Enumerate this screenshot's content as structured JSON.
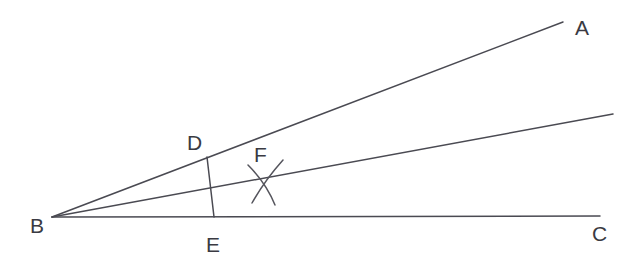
{
  "figure": {
    "kind": "geometry-diagram",
    "background_color": "#ffffff",
    "line_color": "#4a4a52",
    "arc_color": "#55555d",
    "label_color": "#3a3a42",
    "width": 630,
    "height": 277
  },
  "points": {
    "A": {
      "label": "A",
      "x": 575,
      "y": 35
    },
    "B": {
      "label": "B",
      "x": 30,
      "y": 233
    },
    "C": {
      "label": "C",
      "x": 592,
      "y": 241
    },
    "D": {
      "label": "D",
      "x": 187,
      "y": 150
    },
    "E": {
      "label": "E",
      "x": 206,
      "y": 252
    },
    "F": {
      "label": "F",
      "x": 254,
      "y": 162
    }
  },
  "vertices": {
    "B": {
      "x": 52,
      "y": 217
    },
    "A_end": {
      "x": 563,
      "y": 22
    },
    "C_end": {
      "x": 600,
      "y": 216
    },
    "bisector_end": {
      "x": 613,
      "y": 114
    },
    "D": {
      "x": 207,
      "y": 157
    },
    "E": {
      "x": 214,
      "y": 217
    },
    "F": {
      "x": 264,
      "y": 180
    }
  },
  "segments": [
    {
      "name": "ray-BA",
      "from": "B",
      "to": "A_end"
    },
    {
      "name": "ray-BC",
      "from": "B",
      "to": "C_end"
    },
    {
      "name": "ray-bisector",
      "from": "B",
      "to": "bisector_end"
    },
    {
      "name": "segment-DE",
      "from": "D",
      "to": "E"
    }
  ],
  "arcs": [
    {
      "name": "arc-from-D",
      "path": "M 248 165 Q 266 183 275 205"
    },
    {
      "name": "arc-from-E",
      "path": "M 283 160 Q 265 180 252 203"
    }
  ],
  "labels_order": [
    "A",
    "B",
    "C",
    "D",
    "E",
    "F"
  ]
}
